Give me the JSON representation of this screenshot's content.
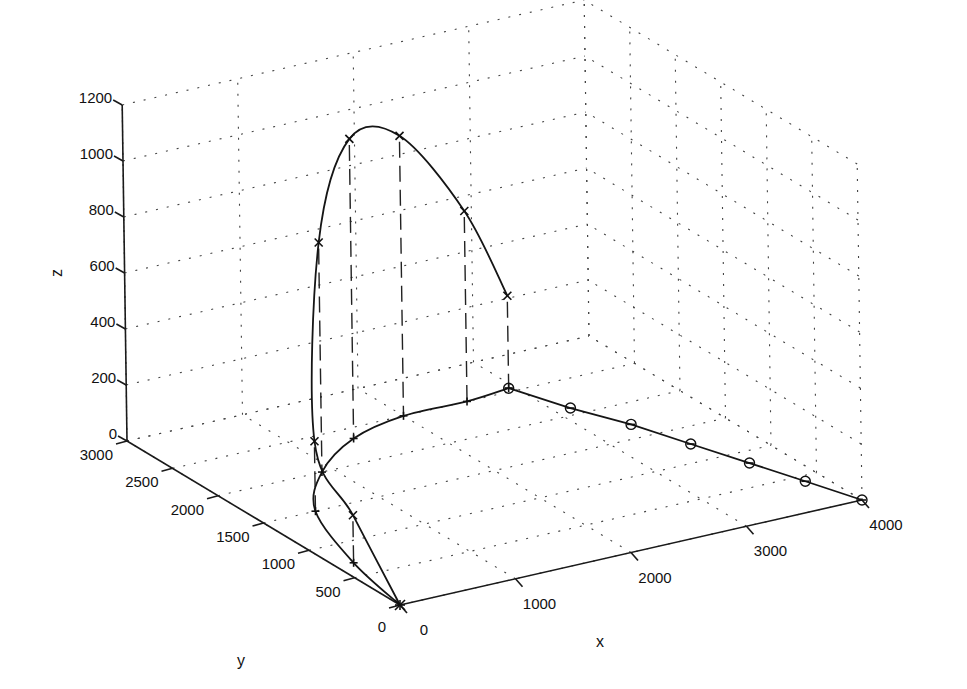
{
  "chart_data": {
    "type": "line3d",
    "title": "",
    "xlabel": "x",
    "ylabel": "y",
    "zlabel": "z",
    "xlim": [
      0,
      4000
    ],
    "ylim": [
      0,
      3000
    ],
    "zlim": [
      0,
      1200
    ],
    "x_ticks": [
      "0",
      "1000",
      "2000",
      "3000",
      "4000"
    ],
    "y_ticks": [
      "0",
      "500",
      "1000",
      "1500",
      "2000",
      "2500",
      "3000"
    ],
    "z_ticks": [
      "0",
      "200",
      "400",
      "600",
      "800",
      "1000",
      "1200"
    ],
    "grid": true,
    "series": [
      {
        "name": "trajectory (x markers)",
        "marker": "x",
        "points_xyz": [
          [
            0,
            0,
            0
          ],
          [
            150,
            700,
            170
          ],
          [
            450,
            1500,
            250
          ],
          [
            900,
            2000,
            820
          ],
          [
            1450,
            2350,
            1070
          ],
          [
            2000,
            2500,
            1000
          ],
          [
            2550,
            2500,
            680
          ],
          [
            2950,
            2550,
            330
          ]
        ]
      },
      {
        "name": "ground projection",
        "marker": "+",
        "points_xyz": [
          [
            0,
            0,
            0
          ],
          [
            150,
            700,
            0
          ],
          [
            450,
            1500,
            0
          ],
          [
            900,
            2000,
            0
          ],
          [
            1450,
            2350,
            0
          ],
          [
            2000,
            2500,
            0
          ],
          [
            2550,
            2500,
            0
          ],
          [
            2950,
            2550,
            0
          ]
        ]
      },
      {
        "name": "ground segment (o markers)",
        "marker": "o",
        "points_xyz": [
          [
            2950,
            2550,
            0
          ],
          [
            3130,
            2100,
            0
          ],
          [
            3340,
            1700,
            0
          ],
          [
            3510,
            1260,
            0
          ],
          [
            3680,
            830,
            0
          ],
          [
            3840,
            420,
            0
          ],
          [
            4000,
            0,
            0
          ]
        ]
      }
    ],
    "droplines": "dashed vertical lines from each trajectory marker to its ground projection"
  }
}
